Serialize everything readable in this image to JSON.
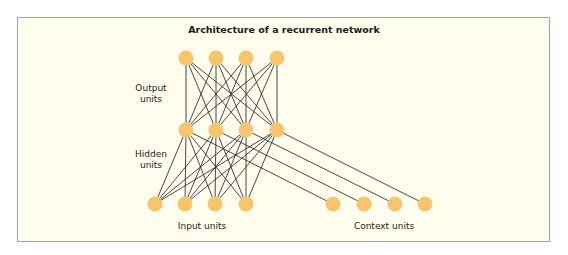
{
  "diagram": {
    "title": "Architecture of a recurrent network",
    "colors": {
      "background": "#fefdee",
      "border": "#8ea4c6",
      "node": "#f7c56e",
      "edge": "#333333"
    },
    "layers": {
      "output": {
        "label_line1": "Output",
        "label_line2": "units",
        "nodes": [
          [
            186,
            58
          ],
          [
            216,
            58
          ],
          [
            246,
            58
          ],
          [
            277,
            58
          ]
        ]
      },
      "hidden": {
        "label_line1": "Hidden",
        "label_line2": "units",
        "nodes": [
          [
            186,
            130
          ],
          [
            216,
            130
          ],
          [
            246,
            130
          ],
          [
            277,
            130
          ]
        ]
      },
      "input": {
        "label": "Input units",
        "nodes": [
          [
            155,
            204
          ],
          [
            185,
            204
          ],
          [
            215,
            204
          ],
          [
            246,
            204
          ]
        ]
      },
      "context": {
        "label": "Context units",
        "nodes": [
          [
            333,
            204
          ],
          [
            364,
            204
          ],
          [
            395,
            204
          ],
          [
            425,
            204
          ]
        ]
      }
    },
    "connections": [
      {
        "from": "hidden",
        "to": "output",
        "type": "full"
      },
      {
        "from": "input",
        "to": "hidden",
        "type": "full"
      },
      {
        "from": "hidden",
        "to": "context",
        "type": "one-to-one"
      }
    ]
  }
}
